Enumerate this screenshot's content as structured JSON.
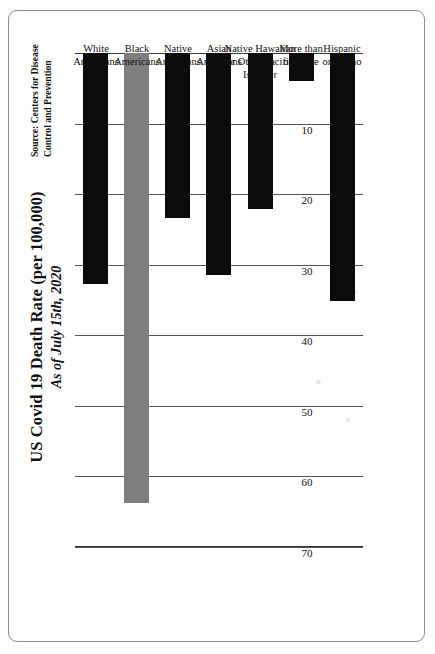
{
  "document": {
    "type": "scanned-chart-page"
  },
  "source_note": "Source: Centers for Disease Control and Prevention",
  "chart_data": {
    "type": "bar",
    "orientation": "vertical",
    "title": "US Covid 19 Death Rate (per 100,000)",
    "subtitle": "As of July 15th, 2020",
    "xlabel": "",
    "ylabel": "",
    "ylim": [
      0,
      70
    ],
    "grid": true,
    "legend": "none",
    "tick_labels": [
      "0",
      "10",
      "20",
      "30",
      "40",
      "50",
      "60",
      "70"
    ],
    "tick_values": [
      0,
      10,
      20,
      30,
      40,
      50,
      60,
      70
    ],
    "categories": [
      "White Americans",
      "Black Americans",
      "Native Americans",
      "Asian Americans",
      "Native Hawaiian or Other Pacific Islander",
      "More than one race",
      "Hispanic or Latino"
    ],
    "values": [
      32.8,
      63.7,
      23.4,
      31.5,
      22.1,
      3.9,
      35.1
    ],
    "bar_colors": [
      "#0b0b0b",
      "#7e7e7e",
      "#0b0b0b",
      "#0b0b0b",
      "#0b0b0b",
      "#0b0b0b",
      "#0b0b0b"
    ],
    "colors": {
      "bar_default": "#0b0b0b",
      "bar_highlight": "#7e7e7e",
      "gridline": "#555555",
      "axis": "#333333",
      "text": "#111111",
      "page": "#ffffff"
    }
  },
  "category_lines": [
    [
      "White",
      "Americans"
    ],
    [
      "Black",
      "Americans"
    ],
    [
      "Native",
      "Americans"
    ],
    [
      "Asian",
      "Americans"
    ],
    [
      "Native Hawaiian",
      "or Other Pacific",
      "Islander"
    ],
    [
      "More than",
      "one race"
    ],
    [
      "Hispanic",
      "or Latino"
    ]
  ]
}
